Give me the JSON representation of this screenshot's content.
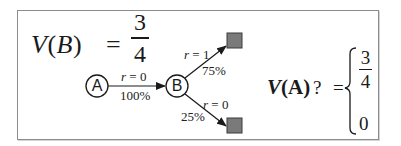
{
  "figure": {
    "value_b": {
      "label_v": "V",
      "label_open": "(",
      "label_state": "B",
      "label_close": ")",
      "equals": "=",
      "numerator": "3",
      "denominator": "4"
    },
    "nodes": [
      {
        "id": "A",
        "label": "A"
      },
      {
        "id": "B",
        "label": "B"
      }
    ],
    "edges": [
      {
        "from": "A",
        "to": "B",
        "reward_var": "r",
        "reward_eq": " = 0",
        "probability": "100%"
      },
      {
        "from": "B",
        "to": "terminal-top",
        "reward_var": "r",
        "reward_eq": " = 1",
        "probability": "75%"
      },
      {
        "from": "B",
        "to": "terminal-bottom",
        "reward_var": "r",
        "reward_eq": " = 0",
        "probability": "25%"
      }
    ],
    "terminals": [
      {
        "id": "terminal-top",
        "color": "#7a7a7a"
      },
      {
        "id": "terminal-bottom",
        "color": "#7a7a7a"
      }
    ],
    "value_a_question": {
      "label_v": "V",
      "label_rest": "(A)",
      "question": "?",
      "equals": "=",
      "option_1_numerator": "3",
      "option_1_denominator": "4",
      "option_2": "0"
    }
  }
}
